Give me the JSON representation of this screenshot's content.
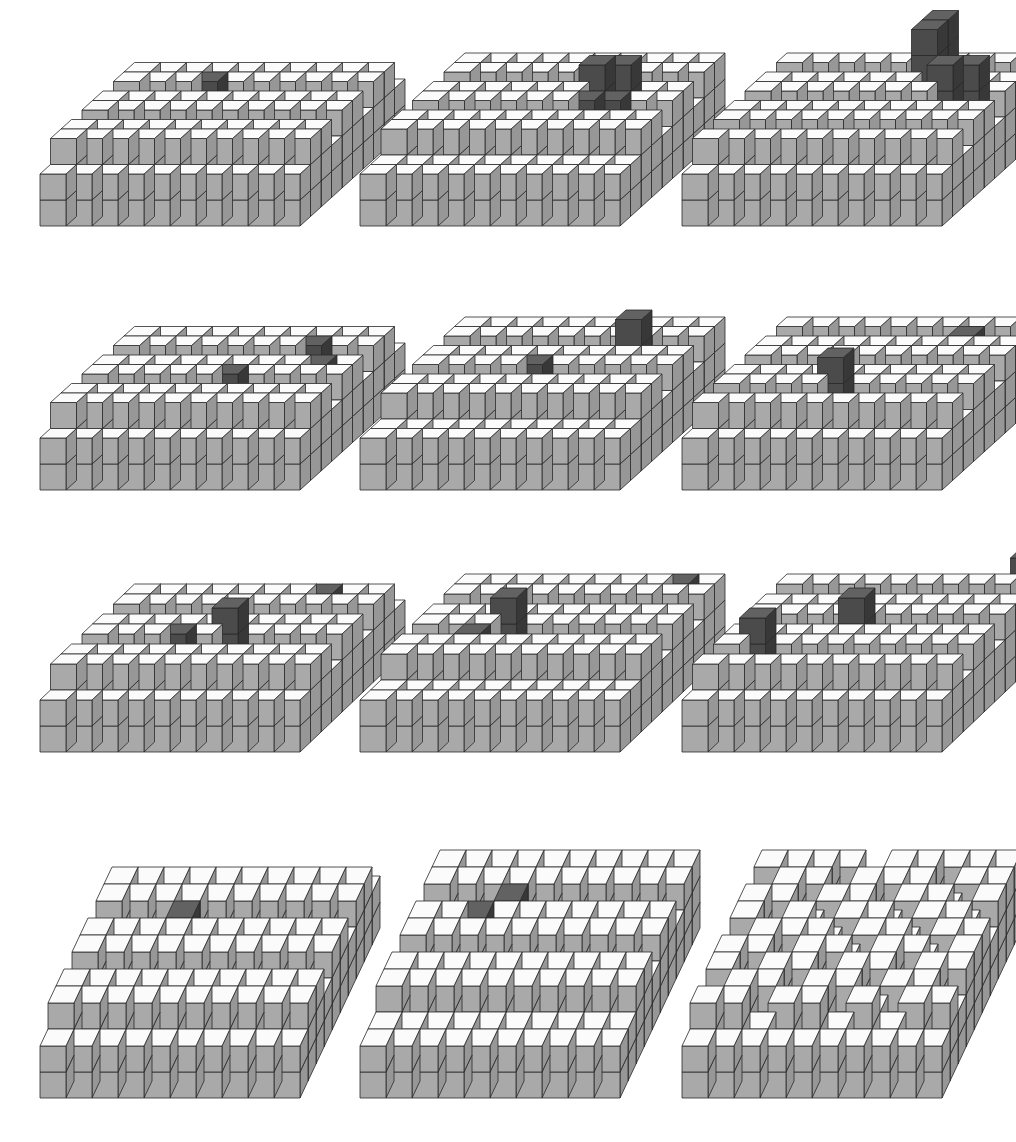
{
  "figure": {
    "layout": {
      "rows": 4,
      "cols": 3
    },
    "colors": {
      "grey_front": "#a9a9a9",
      "grey_side": "#979797",
      "grey_top": "#fbfbfb",
      "dark_front": "#4b4b4b",
      "dark_side": "#383838",
      "dark_top": "#626262",
      "edge": "#2a2a2a"
    },
    "panels": [
      {
        "id": "r1c1",
        "x": 40,
        "base_y": 226,
        "w": 26,
        "h": 26,
        "dx": 10.5,
        "dy": -9.5,
        "dark": [
          [
            3,
            7,
            3
          ]
        ]
      },
      {
        "id": "r1c2",
        "x": 360,
        "base_y": 226,
        "w": 26,
        "h": 26,
        "dx": 10.5,
        "dy": -9.5,
        "dark": [
          [
            6,
            5,
            3
          ],
          [
            6,
            6,
            4
          ],
          [
            7,
            6,
            4
          ],
          [
            7,
            5,
            3
          ]
        ]
      },
      {
        "id": "r1c3",
        "x": 682,
        "base_y": 226,
        "w": 26,
        "h": 26,
        "dx": 10.5,
        "dy": -9.5,
        "dark": [
          [
            6,
            7,
            5
          ],
          [
            6,
            8,
            5
          ],
          [
            7,
            6,
            4
          ],
          [
            8,
            6,
            4
          ]
        ]
      },
      {
        "id": "r2c1",
        "x": 40,
        "base_y": 490,
        "w": 26,
        "h": 26,
        "dx": 10.5,
        "dy": -9.5,
        "dark": [
          [
            5,
            4,
            3
          ],
          [
            7,
            7,
            3
          ],
          [
            8,
            5,
            3
          ]
        ]
      },
      {
        "id": "r2c2",
        "x": 360,
        "base_y": 490,
        "w": 26,
        "h": 26,
        "dx": 10.5,
        "dy": -9.5,
        "dark": [
          [
            4,
            5,
            3
          ],
          [
            7,
            7,
            4
          ]
        ]
      },
      {
        "id": "r2c3",
        "x": 682,
        "base_y": 490,
        "w": 26,
        "h": 26,
        "dx": 10.5,
        "dy": -9.5,
        "dark": [
          [
            4,
            3,
            4
          ],
          [
            7,
            8,
            3
          ]
        ]
      },
      {
        "id": "r3c1",
        "x": 40,
        "base_y": 752,
        "w": 26,
        "h": 26,
        "dx": 10.5,
        "dy": -10,
        "dark": [
          [
            3,
            4,
            3
          ],
          [
            5,
            4,
            4
          ],
          [
            7,
            8,
            3
          ]
        ]
      },
      {
        "id": "r3c2",
        "x": 360,
        "base_y": 752,
        "w": 26,
        "h": 26,
        "dx": 10.5,
        "dy": -10,
        "dark": [
          [
            2,
            4,
            3
          ],
          [
            3,
            5,
            4
          ],
          [
            8,
            9,
            3
          ]
        ]
      },
      {
        "id": "r3c3",
        "x": 682,
        "base_y": 752,
        "w": 26,
        "h": 26,
        "dx": 10.5,
        "dy": -10,
        "dark": [
          [
            1,
            3,
            4
          ],
          [
            4,
            5,
            4
          ],
          [
            9,
            9,
            4
          ]
        ]
      },
      {
        "id": "r4c1",
        "x": 40,
        "base_y": 1098,
        "w": 26,
        "h": 26,
        "dx": 8,
        "dy": -17,
        "dark": [
          [
            3,
            6,
            3
          ]
        ]
      },
      {
        "id": "r4c2",
        "x": 360,
        "base_y": 1098,
        "w": 26,
        "h": 26,
        "dx": 8,
        "dy": -17,
        "dark": [
          [
            2,
            6,
            3
          ],
          [
            3,
            7,
            3
          ]
        ]
      },
      {
        "id": "r4c3",
        "x": 682,
        "base_y": 1098,
        "w": 26,
        "h": 26,
        "dx": 8,
        "dy": -17,
        "dark": []
      }
    ],
    "heightmap": [
      [
        2,
        2,
        2,
        2,
        2,
        2,
        2,
        2,
        2,
        2
      ],
      [
        3,
        2,
        3,
        3,
        2,
        3,
        2,
        3,
        3,
        2
      ],
      [
        2,
        3,
        2,
        2,
        3,
        2,
        3,
        3,
        2,
        3
      ],
      [
        2,
        2,
        3,
        3,
        3,
        3,
        2,
        2,
        3,
        3
      ],
      [
        3,
        2,
        2,
        3,
        2,
        3,
        3,
        2,
        2,
        3
      ],
      [
        2,
        3,
        3,
        2,
        3,
        2,
        2,
        3,
        3,
        2
      ],
      [
        3,
        3,
        2,
        3,
        3,
        3,
        2,
        2,
        3,
        3
      ],
      [
        2,
        3,
        3,
        2,
        2,
        3,
        3,
        3,
        2,
        3
      ],
      [
        3,
        2,
        3,
        3,
        3,
        2,
        3,
        2,
        3,
        3
      ],
      [
        2,
        3,
        2,
        3,
        3,
        3,
        2,
        3,
        3,
        3
      ]
    ],
    "heightmaps_variants": {
      "r4c3": [
        [
          2,
          2,
          2,
          2,
          2,
          2,
          2,
          2,
          2,
          2
        ],
        [
          3,
          3,
          2,
          3,
          3,
          2,
          3,
          2,
          3,
          3
        ],
        [
          2,
          3,
          3,
          2,
          3,
          3,
          2,
          3,
          3,
          2
        ],
        [
          3,
          2,
          3,
          3,
          2,
          3,
          3,
          2,
          3,
          3
        ],
        [
          3,
          3,
          2,
          3,
          3,
          2,
          3,
          3,
          2,
          3
        ],
        [
          2,
          3,
          3,
          3,
          2,
          3,
          3,
          2,
          3,
          3
        ],
        [
          3,
          2,
          3,
          2,
          3,
          3,
          2,
          3,
          3,
          2
        ],
        [
          3,
          3,
          2,
          3,
          3,
          2,
          3,
          3,
          2,
          3
        ],
        [
          2,
          3,
          3,
          2,
          3,
          3,
          3,
          2,
          3,
          3
        ],
        [
          3,
          3,
          3,
          3,
          2,
          3,
          3,
          3,
          3,
          3
        ]
      ]
    }
  }
}
